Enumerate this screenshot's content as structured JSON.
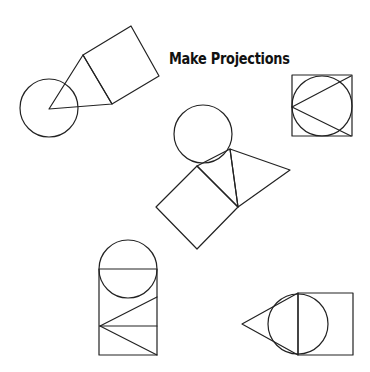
{
  "title": "Make Projections",
  "figures": [
    {
      "name": "circle-triangle-square-diagonal",
      "circle": {
        "cx": 49,
        "cy": 108,
        "r": 29
      },
      "triangle": "49,109 83,55 112,104",
      "square": "83,55 131,26 159,76 112,104"
    },
    {
      "name": "square-inscribed-circle",
      "square": {
        "x": 292,
        "y": 75,
        "w": 60,
        "h": 61
      },
      "circle": {
        "cx": 322,
        "cy": 106,
        "r": 30
      },
      "lines": [
        [
          292,
          107,
          351,
          76
        ],
        [
          292,
          107,
          351,
          136
        ]
      ]
    },
    {
      "name": "circle-triangle-square-center",
      "circle": {
        "cx": 203,
        "cy": 134,
        "r": 29
      },
      "triangle": "197,166 230,149 238,207",
      "triangle2": "230,149 290,170 238,207",
      "square": "197,166 156,207 197,249 238,207"
    },
    {
      "name": "circle-rect-triangles",
      "circle": {
        "cx": 128,
        "cy": 269,
        "r": 29
      },
      "rect": "99,269 157,269 157,355 99,355",
      "lines": [
        [
          100,
          326,
          157,
          297
        ],
        [
          100,
          326,
          157,
          326
        ],
        [
          100,
          326,
          157,
          355
        ]
      ]
    },
    {
      "name": "triangle-circle-rect",
      "circle": {
        "cx": 298,
        "cy": 324,
        "r": 30
      },
      "triangle": "242,324 298,293 298,355",
      "rect": "298,293 353,293 353,355 298,355"
    }
  ]
}
